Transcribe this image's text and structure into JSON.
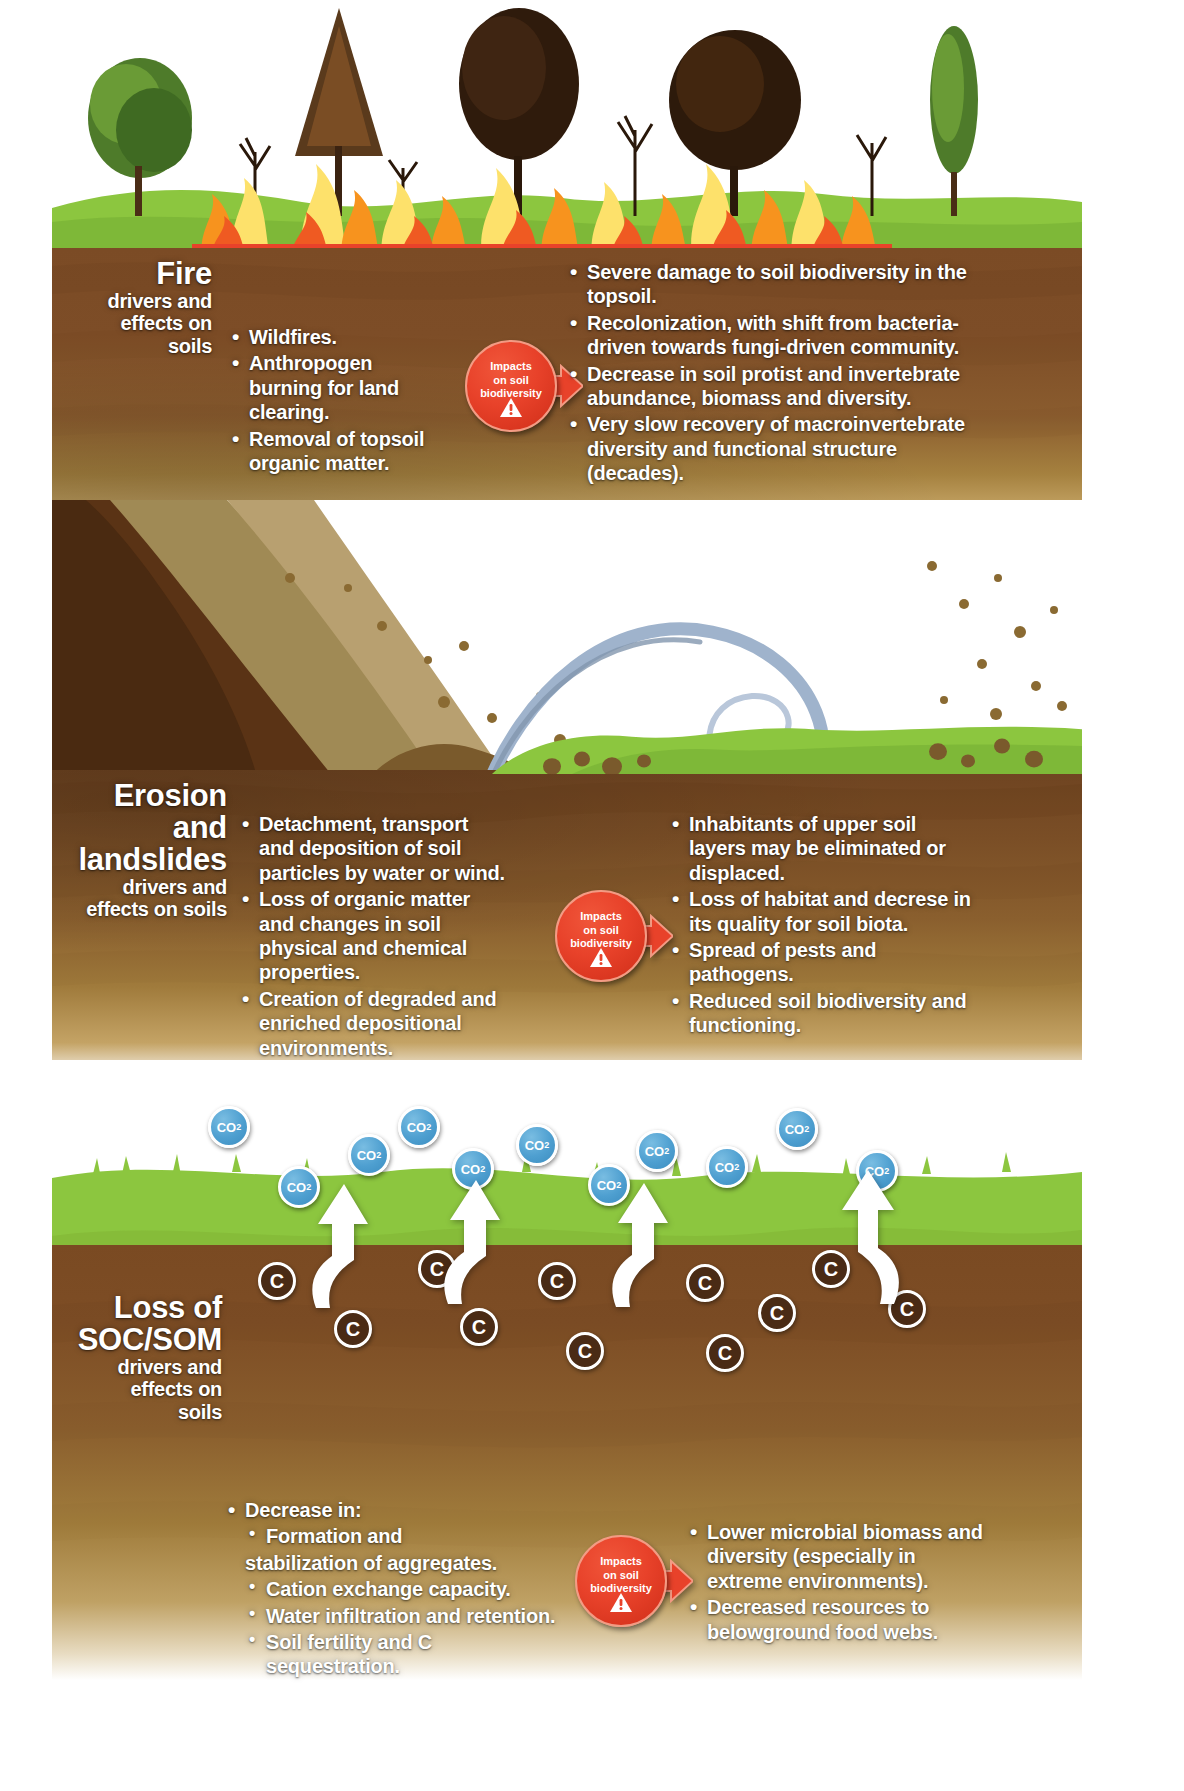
{
  "sections": [
    {
      "id": "fire",
      "title_main": "Fire",
      "title_sub": "drivers and\neffects on\nsoils",
      "title_lines": [
        "drivers and",
        "effects on",
        "soils"
      ],
      "drivers": [
        "Wildfires.",
        "Anthropogen burning for land clearing.",
        "Removal of topsoil organic matter."
      ],
      "effects": [
        "Severe damage to soil biodiversity in the topsoil.",
        "Recolonization, with  shift from bacteria-driven towards fungi-driven community.",
        "Decrease in soil protist and invertebrate abundance, biomass and diversity.",
        "Very slow recovery of macroinvertebrate diversity and functional structure (decades)."
      ]
    },
    {
      "id": "erosion",
      "title_main": "Erosion and\nlandslides",
      "title_main_lines": [
        "Erosion and",
        "landslides"
      ],
      "title_lines": [
        "drivers and",
        "effects on soils"
      ],
      "drivers": [
        "Detachment, transport and deposition of soil particles by water or wind.",
        "Loss of organic matter and changes in soil physical and chemical properties.",
        "Creation of degraded and enriched depositional environments."
      ],
      "effects": [
        "Inhabitants of upper soil layers may be eliminated or displaced.",
        "Loss of habitat and decrese in its quality for soil biota.",
        "Spread of pests and pathogens.",
        "Reduced soil biodiversity and functioning."
      ]
    },
    {
      "id": "soc",
      "title_main": "Loss of\nSOC/SOM",
      "title_main_lines": [
        "Loss of",
        "SOC/SOM"
      ],
      "title_lines": [
        "drivers and",
        "effects on",
        "soils"
      ],
      "drivers": [
        "Decrease in:",
        "Formation and",
        "stabilization of aggregates.",
        "Cation exchange capacity.",
        "Water infiltration and retention.",
        "Soil fertility and C sequestration."
      ],
      "effects": [
        "Lower microbial biomass and diversity (especially in extreme environments).",
        "Decreased resources to belowground food webs."
      ]
    }
  ],
  "badge": {
    "line1": "Impacts",
    "line2": "on soil",
    "line3": "biodiversity",
    "warning_icon": "warning-triangle-icon",
    "color": "#e8422a"
  },
  "chips": {
    "co2_label": "CO",
    "co2_subscript": "2",
    "carbon_label": "C",
    "co2_color": "#4e9fd0",
    "carbon_color": "#4a2b15"
  },
  "palette": {
    "grass": "#8cc63f",
    "soil_dark": "#6f4421",
    "soil_mid": "#8a5f2e",
    "soil_light": "#c4a365",
    "flame_yellow": "#fde16b",
    "flame_orange": "#f7931e",
    "flame_red": "#e8422a",
    "wind_blue": "#9fb3cc",
    "white": "#ffffff"
  }
}
